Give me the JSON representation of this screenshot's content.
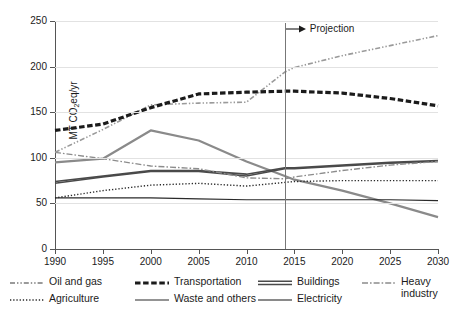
{
  "chart_data": {
    "type": "line",
    "title": "",
    "xlabel": "",
    "ylabel": "MT CO2eq/yr",
    "ylabel_parts": {
      "prefix": "MT CO",
      "sub": "2",
      "suffix": "eq/yr"
    },
    "x": [
      1990,
      1995,
      2000,
      2005,
      2010,
      2014,
      2015,
      2020,
      2025,
      2030
    ],
    "xlim": [
      1990,
      2030
    ],
    "ylim": [
      0,
      250
    ],
    "xticks": [
      1990,
      1995,
      2000,
      2005,
      2010,
      2015,
      2020,
      2025,
      2030
    ],
    "yticks": [
      0,
      50,
      100,
      150,
      200,
      250
    ],
    "grid": "horizontal",
    "legend_position": "below",
    "annotations": [
      {
        "name": "projection-marker",
        "label": "Projection",
        "x": 2014,
        "style": "vertical-line-with-right-arrow"
      }
    ],
    "series": [
      {
        "name": "Oil and gas",
        "style": "dash-dot-dot",
        "color": "#9a9a9a",
        "width": 1.6,
        "values": [
          106,
          131,
          158,
          160,
          161,
          194,
          199,
          212,
          223,
          234
        ]
      },
      {
        "name": "Transportation",
        "style": "dashed-heavy",
        "color": "#1b1b1b",
        "width": 3.2,
        "values": [
          130,
          137,
          155,
          170,
          172,
          173,
          173,
          171,
          165,
          157
        ]
      },
      {
        "name": "Buildings",
        "style": "solid",
        "color": "#4a4a4a",
        "width": 1.7,
        "values": [
          74,
          80,
          86,
          86,
          82,
          89,
          89,
          92,
          95,
          97
        ]
      },
      {
        "name": "Heavy industry",
        "style": "dash-dot",
        "color": "#8c8c8c",
        "width": 1.4,
        "values": [
          106,
          99,
          91,
          88,
          78,
          77,
          79,
          86,
          92,
          96
        ]
      },
      {
        "name": "Agriculture",
        "style": "dotted",
        "color": "#2a2a2a",
        "width": 1.4,
        "values": [
          56,
          64,
          70,
          72,
          69,
          73,
          74,
          75,
          75,
          75
        ]
      },
      {
        "name": "Waste and others",
        "style": "solid-thin",
        "color": "#2a2a2a",
        "width": 1.2,
        "values": [
          56,
          56,
          56,
          55,
          54,
          54,
          54,
          54,
          54,
          53
        ]
      },
      {
        "name": "Electricity",
        "style": "solid-grey",
        "color": "#8a8a8a",
        "width": 2.2,
        "values": [
          95,
          99,
          130,
          119,
          96,
          80,
          76,
          64,
          50,
          35
        ]
      },
      {
        "name": "Buildings-secondary",
        "style": "solid",
        "color": "#4a4a4a",
        "width": 1.5,
        "hidden_from_legend": true,
        "values": [
          72,
          79,
          85,
          85,
          80,
          88,
          88,
          91,
          94,
          96
        ]
      }
    ]
  },
  "legend": {
    "row1": [
      {
        "label": "Oil and gas",
        "swatch": "dash-dot-dot",
        "color": "#9a9a9a"
      },
      {
        "label": "Transportation",
        "swatch": "dashed-heavy",
        "color": "#1b1b1b"
      },
      {
        "label": "Buildings",
        "swatch": "solid-double",
        "color": "#4a4a4a"
      },
      {
        "label": "Heavy\nindustry",
        "swatch": "dash-dot",
        "color": "#8c8c8c"
      }
    ],
    "row2": [
      {
        "label": "Agriculture",
        "swatch": "dotted",
        "color": "#2a2a2a"
      },
      {
        "label": "Waste and others",
        "swatch": "solid-thin",
        "color": "#2a2a2a"
      },
      {
        "label": "Electricity",
        "swatch": "solid-grey",
        "color": "#8a8a8a"
      }
    ]
  }
}
